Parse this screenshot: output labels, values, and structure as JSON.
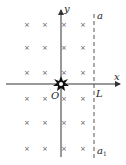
{
  "diagram": {
    "type": "magnetic-field-region",
    "axes": {
      "x_label": "x",
      "y_label": "y",
      "origin_label": "O"
    },
    "boundary": {
      "top_label": "a",
      "bottom_label": "a",
      "bottom_subscript": "1",
      "intersection_label": "L",
      "style": "dashed"
    },
    "field": {
      "symbol": "×",
      "direction": "into-page",
      "columns": 4,
      "rows": 6
    },
    "source": {
      "description": "burst/star at origin"
    }
  }
}
